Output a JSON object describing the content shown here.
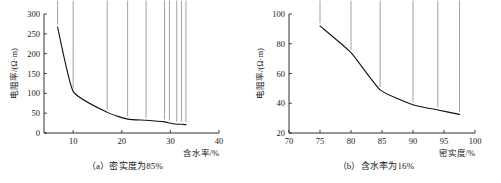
{
  "figure": {
    "panels": [
      {
        "id": "a",
        "caption": "（a）密实度为85%",
        "chart_data": {
          "type": "line",
          "title": "",
          "subtitle": "",
          "xlabel": "含水率/%",
          "ylabel": "电阻率/(Ω·m)",
          "xlim": [
            4,
            40
          ],
          "ylim": [
            0,
            300
          ],
          "xticks": [
            10,
            20,
            30,
            40
          ],
          "xtick_labels": [
            "10",
            "20",
            "30",
            "40"
          ],
          "yticks": [
            0,
            50,
            100,
            150,
            200,
            250,
            300
          ],
          "ytick_labels": [
            "0",
            "50",
            "100",
            "150",
            "200",
            "250",
            "300"
          ],
          "grid": false,
          "legend": "none",
          "marker": "filled-diamond",
          "series": [
            {
              "name": "电阻率",
              "x": [
                6.8,
                10.0,
                17.0,
                21.2,
                25.0,
                28.8,
                29.8,
                31.3,
                32.3,
                33.2
              ],
              "y": [
                267,
                105,
                52,
                35,
                32,
                28,
                25,
                22,
                22,
                21
              ]
            }
          ]
        }
      },
      {
        "id": "b",
        "caption": "（b）含水率为16%",
        "chart_data": {
          "type": "line",
          "title": "",
          "subtitle": "",
          "xlabel": "密实度/%",
          "ylabel": "电阻率/(Ω·m)",
          "xlim": [
            70,
            100
          ],
          "ylim": [
            20,
            100
          ],
          "xticks": [
            70,
            75,
            80,
            85,
            90,
            95,
            100
          ],
          "xtick_labels": [
            "70",
            "75",
            "80",
            "85",
            "90",
            "95",
            "100"
          ],
          "yticks": [
            20,
            40,
            60,
            80,
            100
          ],
          "ytick_labels": [
            "20",
            "40",
            "60",
            "80",
            "100"
          ],
          "grid": false,
          "legend": "none",
          "marker": "filled-diamond",
          "series": [
            {
              "name": "电阻率",
              "x": [
                75.0,
                80.0,
                84.7,
                90.0,
                94.0,
                97.5
              ],
              "y": [
                92,
                74,
                49,
                39,
                35.5,
                32.5
              ]
            }
          ]
        }
      }
    ]
  }
}
